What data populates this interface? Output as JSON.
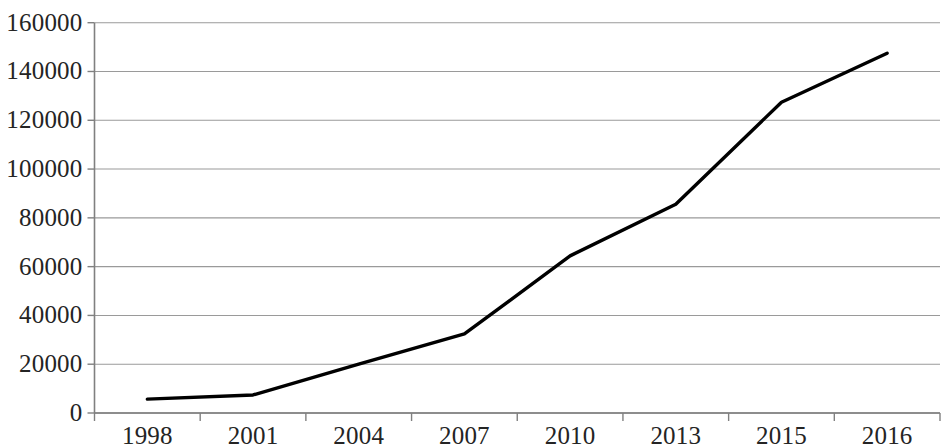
{
  "chart_data": {
    "type": "line",
    "title": "",
    "subtitle": "",
    "xlabel": "",
    "ylabel": "",
    "categories": [
      "1998",
      "2001",
      "2004",
      "2007",
      "2010",
      "2013",
      "2015",
      "2016"
    ],
    "values": [
      5700,
      7400,
      20000,
      32400,
      64400,
      85600,
      127400,
      147500
    ],
    "series": [
      {
        "name": "",
        "values": [
          5700,
          7400,
          20000,
          32400,
          64400,
          85600,
          127400,
          147500
        ]
      }
    ],
    "ylim": [
      0,
      160000
    ],
    "y_ticks": [
      0,
      20000,
      40000,
      60000,
      80000,
      100000,
      120000,
      140000,
      160000
    ],
    "y_tick_labels": [
      "0",
      "20000",
      "40000",
      "60000",
      "80000",
      "100000",
      "120000",
      "140000",
      "160000"
    ],
    "x_tick_labels": [
      "1998",
      "2001",
      "2004",
      "2007",
      "2010",
      "2013",
      "2015",
      "2016"
    ],
    "grid": true,
    "grid_axis": "y",
    "legend": false,
    "legend_position": "none",
    "line_color": "#000000",
    "grid_color": "#9a9a9a",
    "axis_color": "#808080",
    "background_color": "#ffffff",
    "annotations": []
  }
}
